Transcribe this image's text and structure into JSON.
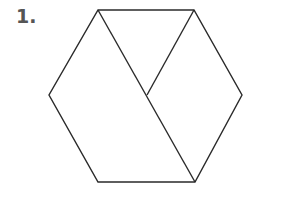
{
  "problem": {
    "number_label": "1."
  },
  "figure": {
    "shape": "hexagon",
    "stroke_color": "#2a2a2a",
    "vertices": {
      "top_left": [
        98,
        10
      ],
      "top_right": [
        194,
        10
      ],
      "right": [
        242,
        95
      ],
      "bottom_right": [
        195,
        182
      ],
      "bottom_left": [
        98,
        182
      ],
      "left": [
        49,
        95
      ],
      "center": [
        147,
        95
      ]
    },
    "internal_segments": [
      [
        "top_left",
        "bottom_right"
      ],
      [
        "top_right",
        "center"
      ]
    ]
  }
}
